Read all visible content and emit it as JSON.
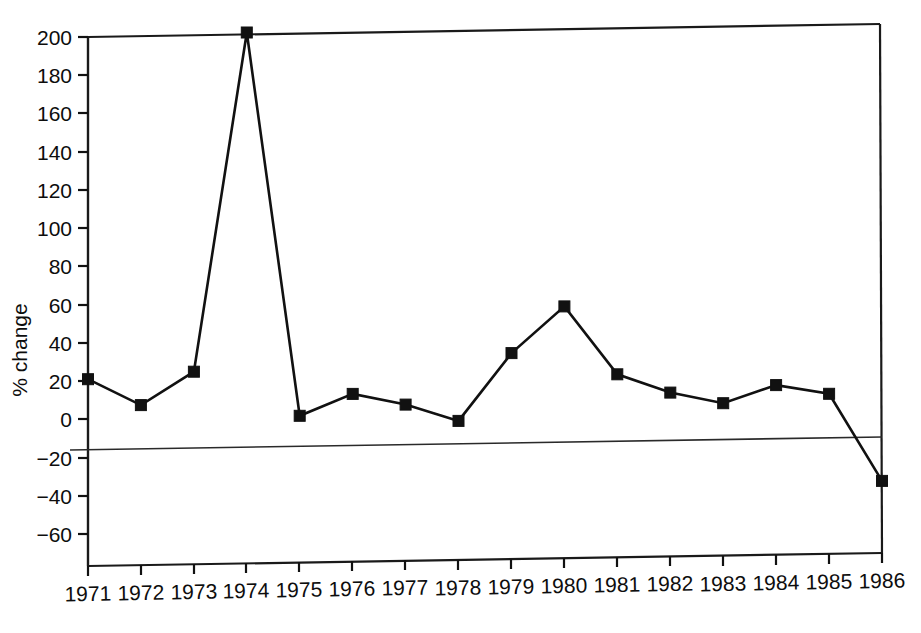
{
  "chart_data": {
    "type": "line",
    "title": "",
    "subtitle": "",
    "xlabel": "",
    "ylabel": "% change",
    "x": [
      1971,
      1972,
      1973,
      1974,
      1975,
      1976,
      1977,
      1978,
      1979,
      1980,
      1981,
      1982,
      1983,
      1984,
      1985,
      1986
    ],
    "categories": [
      "1971",
      "1972",
      "1973",
      "1974",
      "1975",
      "1976",
      "1977",
      "1978",
      "1979",
      "1980",
      "1981",
      "1982",
      "1983",
      "1984",
      "1985",
      "1986"
    ],
    "values": [
      21,
      7,
      24,
      201,
      0,
      11,
      5,
      -4,
      31,
      55,
      19,
      9,
      3,
      12,
      7,
      -39
    ],
    "series": [
      {
        "name": "% change",
        "values": [
          21,
          7,
          24,
          201,
          0,
          11,
          5,
          -4,
          31,
          55,
          19,
          9,
          3,
          12,
          7,
          -39
        ]
      }
    ],
    "xlim": [
      1971,
      1986
    ],
    "ylim": [
      -60,
      200
    ],
    "ytick_labels": [
      "200",
      "180",
      "160",
      "140",
      "120",
      "100",
      "80",
      "60",
      "40",
      "20",
      "0",
      "−20",
      "−40",
      "−60"
    ],
    "ytick_values": [
      200,
      180,
      160,
      140,
      120,
      100,
      80,
      60,
      40,
      20,
      0,
      -20,
      -40,
      -60
    ],
    "xtick_labels": [
      "1971",
      "1972",
      "1973",
      "1974",
      "1975",
      "1976",
      "1977",
      "1978",
      "1979",
      "1980",
      "1981",
      "1982",
      "1983",
      "1984",
      "1985",
      "1986"
    ],
    "grid": false,
    "legend": "none",
    "marker": "square",
    "line_color": "#111111",
    "marker_color": "#111111",
    "background_color": "#ffffff",
    "reference_line": {
      "value": 0,
      "label": "zero reference line"
    },
    "annotations": []
  },
  "figure": {
    "y_axis_title": "% change",
    "peak_year": "1974",
    "peak_value": "201",
    "trough_year": "1986",
    "trough_value": "−39"
  }
}
